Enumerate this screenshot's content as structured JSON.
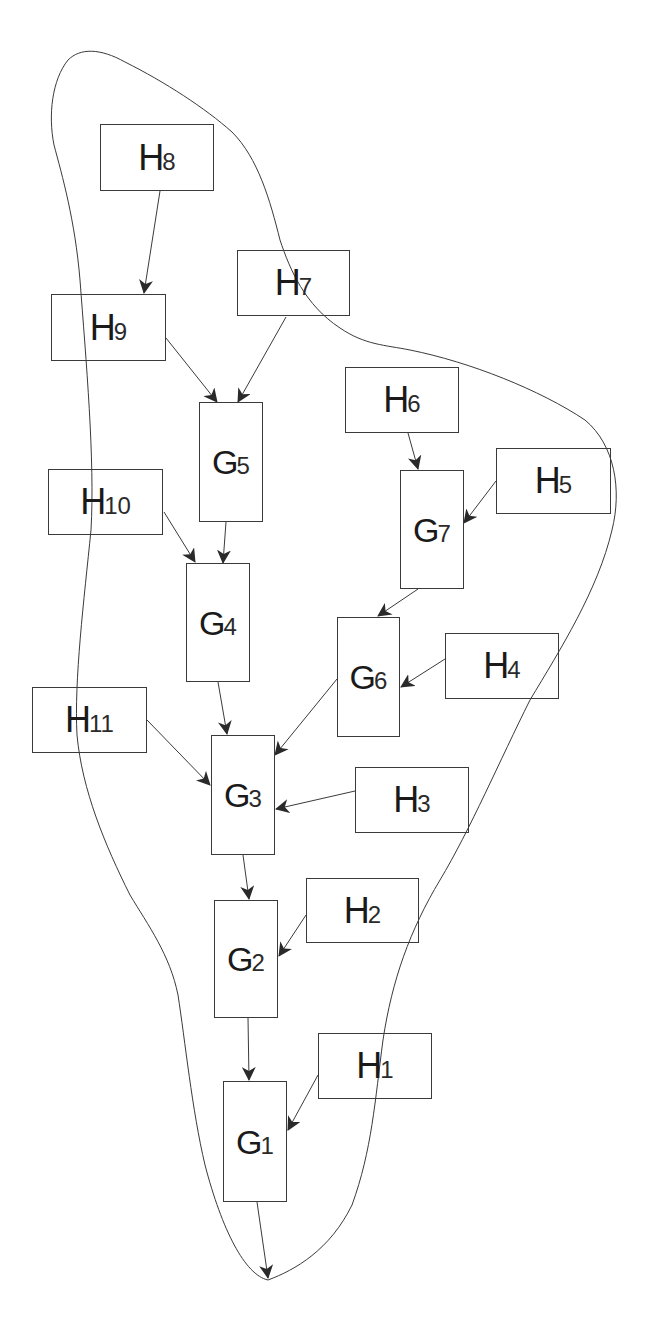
{
  "diagram": {
    "type": "directed-graph",
    "stroke_color": "#3a3a3a",
    "background": "#ffffff",
    "boundary": {
      "name": "enclosing-region",
      "description": "Freehand closed curve enclosing the nodes, with the final arrow from G1 ending at its bottom tip"
    },
    "nodes": [
      {
        "id": "H8",
        "letter": "H",
        "sub": "8",
        "x": 100,
        "y": 124,
        "w": 114,
        "h": 67
      },
      {
        "id": "H7",
        "letter": "H",
        "sub": "7",
        "x": 237,
        "y": 250,
        "w": 113,
        "h": 66
      },
      {
        "id": "H9",
        "letter": "H",
        "sub": "9",
        "x": 51,
        "y": 294,
        "w": 115,
        "h": 67
      },
      {
        "id": "H6",
        "letter": "H",
        "sub": "6",
        "x": 345,
        "y": 367,
        "w": 114,
        "h": 66
      },
      {
        "id": "G5",
        "letter": "G",
        "sub": "5",
        "x": 199,
        "y": 402,
        "w": 64,
        "h": 120
      },
      {
        "id": "H5",
        "letter": "H",
        "sub": "5",
        "x": 496,
        "y": 448,
        "w": 115,
        "h": 66
      },
      {
        "id": "H10",
        "letter": "H",
        "sub": "10",
        "x": 48,
        "y": 469,
        "w": 115,
        "h": 66
      },
      {
        "id": "G7",
        "letter": "G",
        "sub": "7",
        "x": 400,
        "y": 470,
        "w": 64,
        "h": 119
      },
      {
        "id": "G4",
        "letter": "G",
        "sub": "4",
        "x": 186,
        "y": 563,
        "w": 64,
        "h": 119
      },
      {
        "id": "G6",
        "letter": "G",
        "sub": "6",
        "x": 337,
        "y": 617,
        "w": 63,
        "h": 120
      },
      {
        "id": "H4",
        "letter": "H",
        "sub": "4",
        "x": 445,
        "y": 633,
        "w": 114,
        "h": 66
      },
      {
        "id": "H11",
        "letter": "H",
        "sub": "11",
        "x": 32,
        "y": 687,
        "w": 115,
        "h": 66
      },
      {
        "id": "G3",
        "letter": "G",
        "sub": "3",
        "x": 211,
        "y": 735,
        "w": 64,
        "h": 120
      },
      {
        "id": "H3",
        "letter": "H",
        "sub": "3",
        "x": 355,
        "y": 767,
        "w": 114,
        "h": 66
      },
      {
        "id": "H2",
        "letter": "H",
        "sub": "2",
        "x": 306,
        "y": 878,
        "w": 113,
        "h": 65
      },
      {
        "id": "G2",
        "letter": "G",
        "sub": "2",
        "x": 214,
        "y": 900,
        "w": 64,
        "h": 118
      },
      {
        "id": "H1",
        "letter": "H",
        "sub": "1",
        "x": 318,
        "y": 1033,
        "w": 114,
        "h": 66
      },
      {
        "id": "G1",
        "letter": "G",
        "sub": "1",
        "x": 223,
        "y": 1081,
        "w": 64,
        "h": 121
      }
    ],
    "edges": [
      {
        "from": "H8",
        "to": "H9",
        "x1": 160,
        "y1": 191,
        "x2": 144,
        "y2": 293
      },
      {
        "from": "H9",
        "to": "G5",
        "x1": 166,
        "y1": 338,
        "x2": 217,
        "y2": 402
      },
      {
        "from": "H7",
        "to": "G5",
        "x1": 286,
        "y1": 317,
        "x2": 238,
        "y2": 402
      },
      {
        "from": "G5",
        "to": "G4",
        "x1": 226,
        "y1": 522,
        "x2": 223,
        "y2": 563
      },
      {
        "from": "H10",
        "to": "G4",
        "x1": 164,
        "y1": 512,
        "x2": 195,
        "y2": 562
      },
      {
        "from": "H6",
        "to": "G7",
        "x1": 408,
        "y1": 433,
        "x2": 418,
        "y2": 469
      },
      {
        "from": "H5",
        "to": "G7",
        "x1": 496,
        "y1": 481,
        "x2": 464,
        "y2": 523
      },
      {
        "from": "G7",
        "to": "G6",
        "x1": 418,
        "y1": 589,
        "x2": 378,
        "y2": 616
      },
      {
        "from": "H4",
        "to": "G6",
        "x1": 445,
        "y1": 659,
        "x2": 401,
        "y2": 687
      },
      {
        "from": "G4",
        "to": "G3",
        "x1": 218,
        "y1": 682,
        "x2": 227,
        "y2": 734
      },
      {
        "from": "H11",
        "to": "G3",
        "x1": 147,
        "y1": 720,
        "x2": 210,
        "y2": 785
      },
      {
        "from": "G6",
        "to": "G3",
        "x1": 337,
        "y1": 679,
        "x2": 275,
        "y2": 755
      },
      {
        "from": "H3",
        "to": "G3",
        "x1": 355,
        "y1": 791,
        "x2": 276,
        "y2": 809
      },
      {
        "from": "G3",
        "to": "G2",
        "x1": 243,
        "y1": 855,
        "x2": 249,
        "y2": 899
      },
      {
        "from": "H2",
        "to": "G2",
        "x1": 306,
        "y1": 915,
        "x2": 279,
        "y2": 956
      },
      {
        "from": "G2",
        "to": "G1",
        "x1": 248,
        "y1": 1018,
        "x2": 249,
        "y2": 1080
      },
      {
        "from": "H1",
        "to": "G1",
        "x1": 318,
        "y1": 1075,
        "x2": 288,
        "y2": 1130
      },
      {
        "from": "G1",
        "to": "boundary-tip",
        "x1": 257,
        "y1": 1202,
        "x2": 268,
        "y2": 1278
      }
    ]
  }
}
